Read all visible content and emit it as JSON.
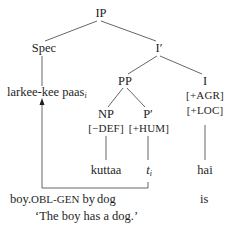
{
  "tree": {
    "root": "IP",
    "spec": "Spec",
    "i_bar": "I′",
    "pp": "PP",
    "i_head": "I",
    "np": "NP",
    "p_bar": "P′",
    "spec_content": {
      "text": "larkee-kee paas",
      "subscript": "i"
    },
    "np_feature": "[−DEF]",
    "p_bar_feature": "[+HUM]",
    "i_features": [
      "[+AGR]",
      "[+LOC]"
    ],
    "leaves": {
      "np_leaf": "kuttaa",
      "trace": {
        "text": "t",
        "subscript": "i"
      },
      "i_leaf": "hai"
    },
    "movement_arrow": {
      "from": "trace t_i",
      "to": "larkee-kee paas_i"
    }
  },
  "gloss": {
    "col1_word": "boy.",
    "col1_smallcaps": "OBL-GEN",
    "col1_rest": " by",
    "col2": "dog",
    "col3": "is"
  },
  "translation": "‘The boy has a dog.’",
  "colors": {
    "text": "#1e1e1e",
    "lines": "#555555",
    "background": "#ffffff"
  }
}
